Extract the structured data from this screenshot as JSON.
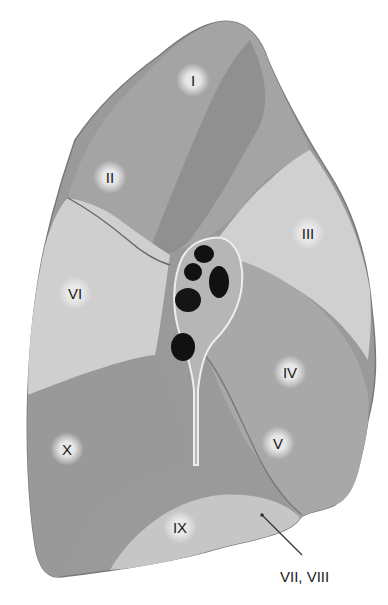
{
  "figure": {
    "colors": {
      "dark": "#8a8a8a",
      "mid": "#a5a5a5",
      "light": "#d2d2d2",
      "hilum": "#b8b8b8",
      "airway": "#111111"
    }
  },
  "segments": [
    {
      "label": "I",
      "x": 193,
      "y": 80
    },
    {
      "label": "II",
      "x": 110,
      "y": 177
    },
    {
      "label": "III",
      "x": 308,
      "y": 233
    },
    {
      "label": "VI",
      "x": 75,
      "y": 293
    },
    {
      "label": "IV",
      "x": 290,
      "y": 372
    },
    {
      "label": "V",
      "x": 278,
      "y": 443
    },
    {
      "label": "X",
      "x": 67,
      "y": 449
    },
    {
      "label": "IX",
      "x": 180,
      "y": 527
    }
  ],
  "callouts": [
    {
      "label": "VII, VIII",
      "x": 312,
      "y": 580
    }
  ]
}
